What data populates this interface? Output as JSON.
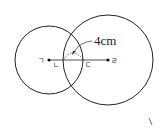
{
  "diagram": {
    "type": "two intersecting circles",
    "points": {
      "giyeok": {
        "label": "ㄱ",
        "desc": "center of left circle"
      },
      "nieun": {
        "label": "ㄴ",
        "desc": "intersection of right circle with segment"
      },
      "digeut": {
        "label": "ㄷ",
        "desc": "intersection of left circle with segment"
      },
      "rieul": {
        "label": "ㄹ",
        "desc": "center of right circle"
      }
    },
    "annotation": {
      "text": "4cm",
      "refers_to": "length between ㄴ and ㄷ"
    },
    "colors": {
      "stroke": "#222222",
      "background": "#ffffff"
    }
  }
}
